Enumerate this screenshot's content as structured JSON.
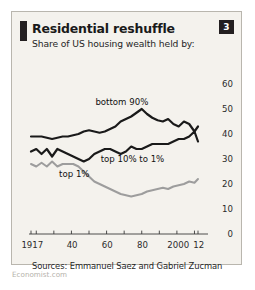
{
  "card": {
    "title": "Residential reshuffle",
    "subtitle": "Share of US housing wealth held by:",
    "badge": "3",
    "sources": "Sources: Emmanuel Saez and Gabriel Zucman",
    "watermark": "Economist.com",
    "bg_color": "#f4f2ed",
    "accent_color": "#231f20"
  },
  "chart_data": {
    "type": "line",
    "title": "Residential reshuffle",
    "subtitle": "Share of US housing wealth held by:",
    "xlabel": "",
    "ylabel": "",
    "ylim": [
      0,
      60
    ],
    "yticks": [
      0,
      10,
      20,
      30,
      40,
      50,
      60
    ],
    "ytick_labels": [
      "0",
      "10",
      "20",
      "30",
      "40",
      "50",
      "60"
    ],
    "y_axis_position": "right",
    "xlim": [
      1917,
      2012
    ],
    "xticks": [
      1917,
      1920,
      1930,
      1940,
      1950,
      1960,
      1970,
      1980,
      1990,
      2000,
      2010,
      2012
    ],
    "xtick_labels": [
      "1917",
      "40",
      "60",
      "80",
      "2000",
      "12"
    ],
    "xtick_label_values": [
      1917,
      1940,
      1960,
      1980,
      2000,
      2012
    ],
    "grid": false,
    "legend": "inline-annotations",
    "series": [
      {
        "name": "bottom 90%",
        "color": "#1a1a1a",
        "label_x": 1967,
        "label_y": 53,
        "x": [
          1917,
          1920,
          1923,
          1926,
          1929,
          1932,
          1935,
          1938,
          1941,
          1944,
          1947,
          1950,
          1953,
          1956,
          1959,
          1962,
          1965,
          1968,
          1971,
          1974,
          1977,
          1980,
          1983,
          1986,
          1989,
          1992,
          1995,
          1998,
          2001,
          2004,
          2007,
          2010,
          2012
        ],
        "values": [
          39,
          39,
          39,
          38.5,
          38,
          38.5,
          39,
          39,
          39.5,
          40,
          41,
          41.5,
          41,
          40.5,
          41,
          42,
          43,
          45,
          46,
          47,
          48.5,
          50,
          48,
          46.5,
          45.5,
          45,
          46,
          44,
          43,
          45,
          44,
          41,
          43
        ]
      },
      {
        "name": "top 10% to 1%",
        "color": "#1a1a1a",
        "label_x": 1974,
        "label_y": 30,
        "x": [
          1917,
          1920,
          1923,
          1926,
          1929,
          1932,
          1935,
          1938,
          1941,
          1944,
          1947,
          1950,
          1953,
          1956,
          1959,
          1962,
          1965,
          1968,
          1971,
          1974,
          1977,
          1980,
          1983,
          1986,
          1989,
          1992,
          1995,
          1998,
          2001,
          2004,
          2007,
          2010,
          2012
        ],
        "values": [
          33,
          34,
          32,
          34,
          31,
          34,
          33,
          32,
          31,
          30,
          29,
          30,
          32,
          33,
          34,
          34,
          33,
          32,
          33,
          35,
          34,
          34,
          35,
          36,
          36,
          36,
          36,
          37,
          38,
          38,
          39,
          41,
          37
        ]
      },
      {
        "name": "top 1%",
        "color": "#9d9d9d",
        "label_x": 1941,
        "label_y": 24,
        "x": [
          1917,
          1920,
          1923,
          1926,
          1929,
          1932,
          1935,
          1938,
          1941,
          1944,
          1947,
          1950,
          1953,
          1956,
          1959,
          1962,
          1965,
          1968,
          1971,
          1974,
          1977,
          1980,
          1983,
          1986,
          1989,
          1992,
          1995,
          1998,
          2001,
          2004,
          2007,
          2010,
          2012
        ],
        "values": [
          28,
          27,
          28.5,
          27,
          29,
          27,
          28,
          28,
          28,
          27,
          25,
          23,
          21,
          20,
          19,
          18,
          17,
          16,
          15.5,
          15,
          15.5,
          16,
          17,
          17.5,
          18,
          18.5,
          18,
          19,
          19.5,
          20,
          21,
          20.5,
          22
        ]
      }
    ]
  }
}
